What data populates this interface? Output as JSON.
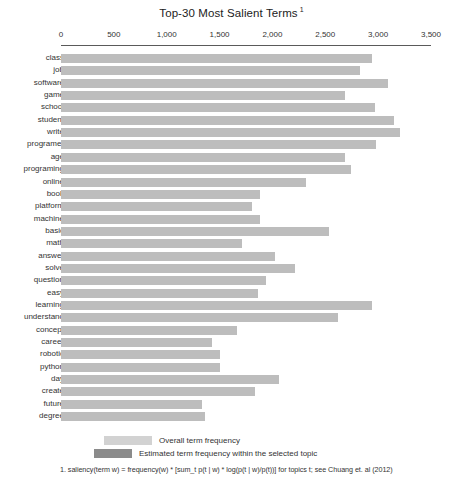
{
  "chart": {
    "title": "Top-30 Most Salient Terms",
    "title_superscript": "1"
  },
  "axis": {
    "ticks": [
      "0",
      "500",
      "1,000",
      "1,500",
      "2,000",
      "2,500",
      "3,000",
      "3,500"
    ]
  },
  "legend": {
    "overall_label": "Overall term frequency",
    "topic_label": "Estimated term frequency within the selected topic"
  },
  "footnote": {
    "text": "1. saliency(term w) = frequency(w) * [sum_t p(t | w) * log(p(t | w)/p(t))] for topics t; see Chuang et. al (2012)"
  },
  "colors": {
    "overall": "#bdbdbd",
    "topic": "#8f8f8f",
    "axis": "#5a5a5a",
    "text": "#333333"
  },
  "chart_data": {
    "type": "bar",
    "orientation": "horizontal",
    "title": "Top-30 Most Salient Terms",
    "xlabel": "",
    "ylabel": "",
    "xlim": [
      0,
      3500
    ],
    "grid": false,
    "legend_position": "bottom",
    "xticks": [
      0,
      500,
      1000,
      1500,
      2000,
      2500,
      3000,
      3500
    ],
    "categories": [
      "class",
      "job",
      "software",
      "game",
      "school",
      "student",
      "write",
      "programer",
      "age",
      "programing",
      "online",
      "book",
      "platform",
      "machine",
      "basic",
      "math",
      "answer",
      "solve",
      "question",
      "easy",
      "learning",
      "understand",
      "concept",
      "career",
      "robotic",
      "python",
      "day",
      "create",
      "future",
      "degree"
    ],
    "series": [
      {
        "name": "Overall term frequency",
        "values": [
          2940,
          2830,
          3095,
          2690,
          2970,
          3150,
          3210,
          2980,
          2690,
          2745,
          2320,
          1885,
          1810,
          1885,
          2535,
          1715,
          2025,
          2215,
          1940,
          1865,
          2940,
          2620,
          1665,
          1430,
          1505,
          1505,
          2065,
          1835,
          1335,
          1360
        ]
      },
      {
        "name": "Estimated term frequency within the selected topic",
        "values": [
          0,
          0,
          0,
          0,
          0,
          0,
          0,
          0,
          0,
          0,
          0,
          0,
          0,
          0,
          0,
          0,
          0,
          0,
          0,
          0,
          0,
          0,
          0,
          0,
          0,
          0,
          0,
          0,
          0,
          0
        ]
      }
    ]
  },
  "layout": {
    "x0_px": 61,
    "px_per_unit": 0.10571,
    "row_top_px": 3,
    "row_pitch_px": 12.35
  }
}
